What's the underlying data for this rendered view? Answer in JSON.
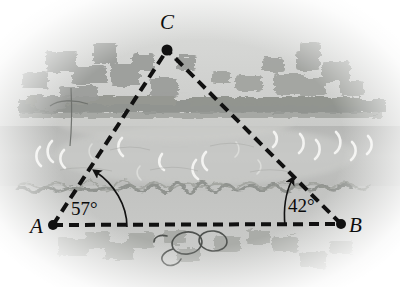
{
  "figure": {
    "type": "geometry-diagram",
    "description_scene": "lake-landscape",
    "canvas": {
      "width": 400,
      "height": 287
    },
    "palette": {
      "background": "#ffffff",
      "land_upper": "#c3c4c3",
      "sky_haze": "#d5d6d5",
      "water": "#bcbdbb",
      "water_light": "#c8c9c7",
      "foreground": "#c6c7c5",
      "foliage": "#9b9d9a",
      "treeline": "#8e918d",
      "shoreline": "#8d908c",
      "wave_white": "#f4f4f2",
      "ink": "#111111"
    },
    "points": [
      {
        "id": "A",
        "label": "A",
        "x": 53,
        "y": 225,
        "label_x": 30,
        "label_y": 216
      },
      {
        "id": "B",
        "label": "B",
        "x": 341,
        "y": 224,
        "label_x": 349,
        "label_y": 215
      },
      {
        "id": "C",
        "label": "C",
        "x": 167,
        "y": 50,
        "label_x": 160,
        "label_y": 12
      }
    ],
    "segments": [
      {
        "id": "AB",
        "from": "A",
        "to": "B",
        "style": "dashed"
      },
      {
        "id": "AC",
        "from": "A",
        "to": "C",
        "style": "dashed"
      },
      {
        "id": "BC",
        "from": "B",
        "to": "C",
        "style": "dashed"
      }
    ],
    "angles": [
      {
        "id": "angle-A",
        "at": "A",
        "value": "57°",
        "label_x": 71,
        "label_y": 199
      },
      {
        "id": "angle-B",
        "at": "B",
        "value": "42°",
        "label_x": 288,
        "label_y": 196
      }
    ],
    "line_style": {
      "dash_length": 10,
      "dash_gap": 6,
      "stroke_width": 4,
      "color": "#111111"
    },
    "vertex_dot_radius": 5
  }
}
